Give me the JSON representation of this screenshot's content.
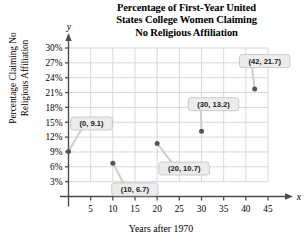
{
  "title": {
    "lines": [
      "Percentage of First-Year United",
      "States College Women Claiming",
      "No Religious Affiliation"
    ]
  },
  "axes": {
    "x_caption": "Years after 1970",
    "y_caption_lines": [
      "Percentage Claiming No",
      "Religious Affiliation"
    ],
    "x_symbol": "x",
    "y_symbol": "y"
  },
  "chart_data": {
    "type": "scatter",
    "title": "Percentage of First-Year United States College Women Claiming No Religious Affiliation",
    "xlabel": "Years after 1970",
    "ylabel": "Percentage Claiming No Religious Affiliation",
    "xlim": [
      0,
      45
    ],
    "ylim": [
      0,
      30
    ],
    "grid": true,
    "legend": "none",
    "x_ticks": [
      5,
      10,
      15,
      20,
      25,
      30,
      35,
      40,
      45
    ],
    "x_tick_labels": [
      "5",
      "10",
      "15",
      "20",
      "25",
      "30",
      "35",
      "40",
      "45"
    ],
    "y_ticks": [
      3,
      6,
      9,
      12,
      15,
      18,
      21,
      24,
      27,
      30
    ],
    "y_tick_labels": [
      "3%",
      "6%",
      "9%",
      "12%",
      "15%",
      "18%",
      "21%",
      "24%",
      "27%",
      "30%"
    ],
    "points": [
      {
        "x": 0,
        "y": 9.1,
        "label": "(0, 9.1)"
      },
      {
        "x": 10,
        "y": 6.7,
        "label": "(10, 6.7)"
      },
      {
        "x": 20,
        "y": 10.7,
        "label": "(20, 10.7)"
      },
      {
        "x": 30,
        "y": 13.2,
        "label": "(30, 13.2)"
      },
      {
        "x": 42,
        "y": 21.7,
        "label": "(42, 21.7)"
      }
    ]
  },
  "colors": {
    "axis": "#4d4d4d",
    "grid": "#d4d4d4",
    "marker": "#555555",
    "callout_fill": "#ececec",
    "callout_stroke": "#c0c0c0",
    "text": "#000000"
  }
}
